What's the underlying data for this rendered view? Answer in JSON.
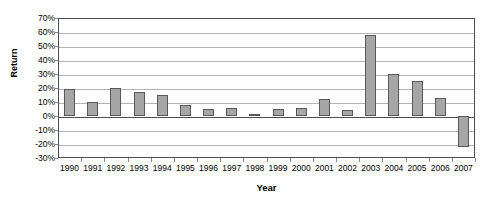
{
  "chart_data": {
    "type": "bar",
    "title": "",
    "xlabel": "Year",
    "ylabel": "Return",
    "categories": [
      "1990",
      "1991",
      "1992",
      "1993",
      "1994",
      "1995",
      "1996",
      "1997",
      "1998",
      "1999",
      "2000",
      "2001",
      "2002",
      "2003",
      "2004",
      "2005",
      "2006",
      "2007"
    ],
    "values": [
      19,
      10,
      20,
      17,
      15,
      8,
      5,
      6,
      1.5,
      5,
      6,
      12,
      4,
      58,
      30,
      25,
      13,
      -22
    ],
    "value_labels": [
      "19%",
      "10%",
      "20%",
      "17%",
      "15%",
      "8%",
      "5%",
      "6%",
      "1.5%",
      "5%",
      "6%",
      "12%",
      "4%",
      "58%",
      "30%",
      "25%",
      "13%",
      "-22%"
    ],
    "ylim": [
      -30,
      70
    ],
    "ytick_labels": [
      "70%",
      "60%",
      "50%",
      "40%",
      "30%",
      "20%",
      "10%",
      "0%",
      "-10%",
      "-20%",
      "-30%"
    ],
    "ytick_values": [
      70,
      60,
      50,
      40,
      30,
      20,
      10,
      0,
      -10,
      -20,
      -30
    ],
    "grid": true,
    "legend": "none",
    "bar_color": "#a6a6a6",
    "bar_border_color": "#595959",
    "gridline_color": "#b3b3b3",
    "axis_color": "#4d4d4d"
  }
}
